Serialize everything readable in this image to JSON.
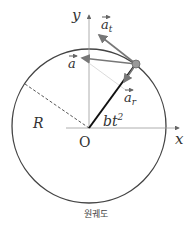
{
  "diagram": {
    "caption": "원궤도",
    "labels": {
      "y_axis": "y",
      "x_axis": "x",
      "origin": "O",
      "radius": "R",
      "angle": "bt",
      "angle_exp": "2",
      "vec_a": "a",
      "vec_at": "a",
      "vec_at_sub": "t",
      "vec_ar": "a",
      "vec_ar_sub": "r"
    },
    "colors": {
      "circle": "#444444",
      "axes": "#888888",
      "radius_line": "#111111",
      "vectors": "#777777",
      "particle": "#999999"
    }
  }
}
